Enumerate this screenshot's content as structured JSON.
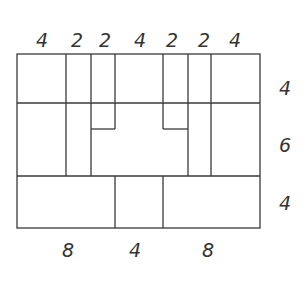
{
  "diagram": {
    "type": "rectangle-partition",
    "line_color": "#3a3a3a",
    "top_labels": [
      {
        "text": "4",
        "x": 42
      },
      {
        "text": "2",
        "x": 77
      },
      {
        "text": "2",
        "x": 105
      },
      {
        "text": "4",
        "x": 140
      },
      {
        "text": "2",
        "x": 172
      },
      {
        "text": "2",
        "x": 204
      },
      {
        "text": "4",
        "x": 235
      }
    ],
    "right_labels": [
      {
        "text": "4",
        "y": 88
      },
      {
        "text": "6",
        "y": 145
      },
      {
        "text": "4",
        "y": 203
      }
    ],
    "bottom_labels": [
      {
        "text": "8",
        "x": 68
      },
      {
        "text": "4",
        "x": 135
      },
      {
        "text": "8",
        "x": 208
      }
    ]
  }
}
